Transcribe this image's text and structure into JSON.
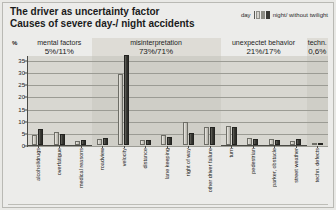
{
  "title": {
    "line1": "The driver as uncertainty factor",
    "line2": "Causes of severe day-/ night accidents"
  },
  "legend": {
    "day_label": "day",
    "night_label": "night/ without twilight",
    "colors": {
      "day": "#cfcdc6",
      "night": "#3c3c37"
    }
  },
  "axis": {
    "y_unit": "%",
    "y_ticks": [
      "35",
      "30",
      "25",
      "20",
      "15",
      "10",
      "5",
      "0"
    ],
    "y_min": 0,
    "y_max": 37
  },
  "categories": [
    {
      "name": "mental factors",
      "pct": "5%/11%"
    },
    {
      "name": "misinterpretation",
      "pct": "73%/71%"
    },
    {
      "name": "unexpectet behavior",
      "pct": "21%/17%"
    },
    {
      "name": "techn.",
      "pct": "0,6%"
    }
  ],
  "chart_data": {
    "type": "bar",
    "xlabel": "",
    "ylabel": "%",
    "ylim": [
      0,
      37
    ],
    "grid": true,
    "legend_position": "top-right",
    "categories": [
      "alcohol/drugs",
      "overfatigue",
      "medical reasons",
      "roadview",
      "velocity",
      "distance",
      "lane keeping",
      "right of way",
      "other driver failure",
      "turn",
      "pedestrian",
      "parker, obstacle",
      "street  weather",
      "techn. defects"
    ],
    "series": [
      {
        "name": "day",
        "values": [
          4.0,
          5.5,
          1.5,
          2.5,
          29.0,
          2.0,
          4.0,
          9.5,
          7.5,
          8.0,
          3.0,
          2.5,
          1.5,
          0.6
        ]
      },
      {
        "name": "night",
        "values": [
          6.5,
          4.5,
          2.0,
          3.0,
          37.0,
          2.0,
          3.5,
          5.0,
          7.5,
          7.5,
          2.5,
          2.0,
          2.5,
          0.6
        ]
      }
    ],
    "group_spans": [
      {
        "label": "mental factors",
        "pct": "5%/11%",
        "from": 0,
        "to": 2
      },
      {
        "label": "misinterpretation",
        "pct": "73%/71%",
        "from": 3,
        "to": 8
      },
      {
        "label": "unexpectet behavior",
        "pct": "21%/17%",
        "from": 9,
        "to": 12
      },
      {
        "label": "techn.",
        "pct": "0,6%",
        "from": 13,
        "to": 13
      }
    ]
  }
}
